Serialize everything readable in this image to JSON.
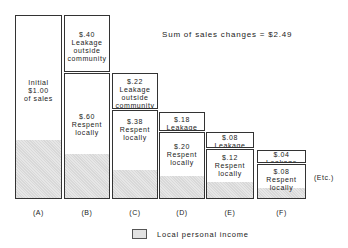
{
  "title": "Sum of sales changes = $2.49",
  "columns": [
    {
      "id": "A",
      "label": "(A)",
      "boxes": [
        {
          "text": "Initial\n$1.00\nof sales",
          "x": 15,
          "y": 15,
          "w": 47,
          "h": 184,
          "shade": 58,
          "ty": 62
        }
      ]
    },
    {
      "id": "B",
      "label": "(B)",
      "boxes": [
        {
          "text": "$.40\nLeakage\noutside\ncommunity",
          "x": 64,
          "y": 15,
          "w": 46,
          "h": 57,
          "shade": 0,
          "ty": 14
        },
        {
          "text": "$.60\nRespent\nlocally",
          "x": 64,
          "y": 73,
          "w": 46,
          "h": 126,
          "shade": 44,
          "ty": 38
        }
      ]
    },
    {
      "id": "C",
      "label": "(C)",
      "boxes": [
        {
          "text": "$.22\nLeakage\noutside\ncommunity",
          "x": 112,
          "y": 73,
          "w": 46,
          "h": 36,
          "shade": 0,
          "ty": 3
        },
        {
          "text": "$.38\nRespent\nlocally",
          "x": 112,
          "y": 110,
          "w": 46,
          "h": 89,
          "shade": 28,
          "ty": 6
        }
      ]
    },
    {
      "id": "D",
      "label": "(D)",
      "boxes": [
        {
          "text": "$.18\nLeakage",
          "x": 159,
          "y": 112,
          "w": 46,
          "h": 19,
          "shade": 0,
          "ty": 2
        },
        {
          "text": "$.20\nRespent\nlocally",
          "x": 159,
          "y": 132,
          "w": 46,
          "h": 67,
          "shade": 22,
          "ty": 9
        }
      ]
    },
    {
      "id": "E",
      "label": "(E)",
      "boxes": [
        {
          "text": "$.08\nLeakage",
          "x": 206,
          "y": 132,
          "w": 48,
          "h": 16,
          "shade": 0,
          "ty": 0
        },
        {
          "text": "$.12\nRespent\nlocally",
          "x": 206,
          "y": 149,
          "w": 48,
          "h": 50,
          "shade": 16,
          "ty": 3
        }
      ]
    },
    {
      "id": "F",
      "label": "(F)",
      "boxes": [
        {
          "text": "$.04\nLeakage",
          "x": 257,
          "y": 150,
          "w": 49,
          "h": 13,
          "shade": 0,
          "ty": -1
        },
        {
          "text": "$.08\nRespent\nlocally",
          "x": 257,
          "y": 164,
          "w": 49,
          "h": 35,
          "shade": 10,
          "ty": 2
        }
      ]
    }
  ],
  "etc_label": "(Etc.)",
  "legend": {
    "label": "Local personal income"
  }
}
